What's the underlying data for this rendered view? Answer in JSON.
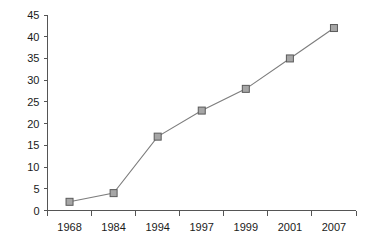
{
  "chart_data": {
    "type": "line",
    "title": "",
    "subtitle": "",
    "xlabel": "",
    "ylabel": "",
    "categories": [
      "1968",
      "1984",
      "1994",
      "1997",
      "1999",
      "2001",
      "2007"
    ],
    "values": [
      2,
      4,
      17,
      23,
      28,
      35,
      42
    ],
    "series": [
      {
        "name": "",
        "values": [
          2,
          4,
          17,
          23,
          28,
          35,
          42
        ]
      }
    ],
    "ylim": [
      0,
      45
    ],
    "y_ticks": [
      0,
      5,
      10,
      15,
      20,
      25,
      30,
      35,
      40,
      45
    ],
    "y_tick_labels": [
      "0",
      "5",
      "10",
      "15",
      "20",
      "25",
      "30",
      "35",
      "40",
      "45"
    ],
    "x_tick_labels": [
      "1968",
      "1984",
      "1994",
      "1997",
      "1999",
      "2001",
      "2007"
    ],
    "grid": false,
    "legend": false,
    "legend_position": "none",
    "marker": "square",
    "colors": {
      "line": "#7d7d7d",
      "marker_fill": "#a6a6a6",
      "marker_stroke": "#5a5a5a",
      "axis": "#555555",
      "text": "#1a1a1a",
      "background": "#ffffff"
    }
  }
}
